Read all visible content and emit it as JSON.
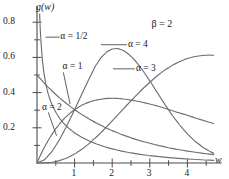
{
  "chart_data": {
    "type": "line",
    "title": "",
    "subtitle": "",
    "xlabel": "w",
    "ylabel": "g(w)",
    "xlim": [
      0,
      4.75
    ],
    "ylim": [
      0,
      0.88
    ],
    "xticks": [
      "1",
      "2",
      "3",
      "4"
    ],
    "xtick_values": [
      1,
      2,
      3,
      4
    ],
    "x_minor_step": 0.5,
    "yticks": [
      "0.2",
      "0.4",
      "0.6",
      "0.8"
    ],
    "ytick_values": [
      0.2,
      0.4,
      0.6,
      0.8
    ],
    "y_minor_step": 0.1,
    "grid": false,
    "legend_position": "inline-annotations",
    "annotation": "β = 2",
    "annotation_x": 3.1,
    "annotation_y": 0.79,
    "distribution": "gamma",
    "beta": 2,
    "series": [
      {
        "name": "α = 1/2",
        "alpha": 0.5,
        "label": "α = 1/2",
        "label_x": 0.62,
        "label_y": 0.715,
        "leader_from": [
          0.6,
          0.715
        ],
        "leader_to": [
          0.23,
          0.715
        ],
        "peak_x": 0.0,
        "peak_y": 0.88,
        "points": [
          [
            0.02,
            1.58
          ],
          [
            0.04,
            1.12
          ],
          [
            0.06,
            0.913
          ],
          [
            0.08,
            0.789
          ],
          [
            0.1,
            0.704
          ],
          [
            0.14,
            0.591
          ],
          [
            0.18,
            0.518
          ],
          [
            0.22,
            0.465
          ],
          [
            0.26,
            0.424
          ],
          [
            0.3,
            0.391
          ],
          [
            0.35,
            0.358
          ],
          [
            0.4,
            0.331
          ],
          [
            0.5,
            0.288
          ],
          [
            0.6,
            0.255
          ],
          [
            0.7,
            0.228
          ],
          [
            0.8,
            0.206
          ],
          [
            0.9,
            0.188
          ],
          [
            1.0,
            0.171
          ],
          [
            1.2,
            0.145
          ],
          [
            1.4,
            0.124
          ],
          [
            1.6,
            0.107
          ],
          [
            1.8,
            0.0922
          ],
          [
            2.0,
            0.0801
          ],
          [
            2.25,
            0.0677
          ],
          [
            2.5,
            0.0575
          ],
          [
            2.75,
            0.049
          ],
          [
            3.0,
            0.0419
          ],
          [
            3.25,
            0.0359
          ],
          [
            3.5,
            0.0309
          ],
          [
            3.75,
            0.0266
          ],
          [
            4.0,
            0.0229
          ],
          [
            4.25,
            0.0198
          ],
          [
            4.5,
            0.0171
          ],
          [
            4.7,
            0.0153
          ]
        ]
      },
      {
        "name": "α = 1",
        "alpha": 1,
        "label": "α = 1",
        "label_x": 0.68,
        "label_y": 0.545,
        "leader_from": [
          0.7,
          0.515
        ],
        "leader_to": [
          0.88,
          0.335
        ],
        "peak_x": 0.0,
        "peak_y": 0.5,
        "points": [
          [
            0.0,
            0.5
          ],
          [
            0.1,
            0.476
          ],
          [
            0.2,
            0.452
          ],
          [
            0.3,
            0.43
          ],
          [
            0.4,
            0.409
          ],
          [
            0.5,
            0.389
          ],
          [
            0.6,
            0.37
          ],
          [
            0.8,
            0.335
          ],
          [
            1.0,
            0.303
          ],
          [
            1.2,
            0.274
          ],
          [
            1.4,
            0.248
          ],
          [
            1.6,
            0.225
          ],
          [
            1.8,
            0.203
          ],
          [
            2.0,
            0.184
          ],
          [
            2.25,
            0.162
          ],
          [
            2.5,
            0.143
          ],
          [
            2.75,
            0.126
          ],
          [
            3.0,
            0.112
          ],
          [
            3.25,
            0.0986
          ],
          [
            3.5,
            0.0869
          ],
          [
            3.75,
            0.0766
          ],
          [
            4.0,
            0.0677
          ],
          [
            4.25,
            0.0596
          ],
          [
            4.5,
            0.0527
          ],
          [
            4.7,
            0.0477
          ]
        ]
      },
      {
        "name": "α = 2",
        "alpha": 2,
        "label": "α = 2",
        "label_x": 0.13,
        "label_y": 0.315,
        "leader_from": [
          0.3,
          0.288
        ],
        "leader_to": [
          0.52,
          0.155
        ],
        "peak_x": 1.4,
        "peak_y": 0.432,
        "points": [
          [
            0.0,
            0.0
          ],
          [
            0.1,
            0.0476
          ],
          [
            0.2,
            0.0905
          ],
          [
            0.3,
            0.129
          ],
          [
            0.4,
            0.164
          ],
          [
            0.5,
            0.195
          ],
          [
            0.6,
            0.222
          ],
          [
            0.7,
            0.247
          ],
          [
            0.8,
            0.268
          ],
          [
            0.9,
            0.287
          ],
          [
            1.0,
            0.303
          ],
          [
            1.1,
            0.317
          ],
          [
            1.2,
            0.329
          ],
          [
            1.3,
            0.339
          ],
          [
            1.4,
            0.347
          ],
          [
            1.5,
            0.354
          ],
          [
            1.6,
            0.359
          ],
          [
            1.8,
            0.366
          ],
          [
            2.0,
            0.368
          ],
          [
            2.2,
            0.366
          ],
          [
            2.4,
            0.361
          ],
          [
            2.6,
            0.354
          ],
          [
            2.8,
            0.345
          ],
          [
            3.0,
            0.335
          ],
          [
            3.25,
            0.321
          ],
          [
            3.5,
            0.304
          ],
          [
            3.75,
            0.287
          ],
          [
            4.0,
            0.271
          ],
          [
            4.25,
            0.253
          ],
          [
            4.5,
            0.237
          ],
          [
            4.7,
            0.224
          ]
        ]
      },
      {
        "name": "α = 3",
        "alpha": 3,
        "label": "α = 3",
        "label_x": 2.63,
        "label_y": 0.535,
        "leader_from": [
          2.6,
          0.535
        ],
        "leader_to": [
          2.02,
          0.535
        ],
        "peak_x": 1.7,
        "peak_y": 0.598,
        "points": [
          [
            0.0,
            0.0
          ],
          [
            0.2,
            0.0182
          ],
          [
            0.4,
            0.0657
          ],
          [
            0.6,
            0.133
          ],
          [
            0.8,
            0.214
          ],
          [
            1.0,
            0.303
          ],
          [
            1.2,
            0.395
          ],
          [
            1.4,
            0.485
          ],
          [
            1.55,
            0.55
          ],
          [
            1.7,
            0.598
          ],
          [
            1.85,
            0.63
          ],
          [
            2.0,
            0.648
          ],
          [
            2.15,
            0.65
          ],
          [
            2.3,
            0.639
          ],
          [
            2.45,
            0.616
          ],
          [
            2.6,
            0.584
          ],
          [
            2.8,
            0.53
          ],
          [
            3.0,
            0.467
          ],
          [
            3.2,
            0.4
          ],
          [
            3.4,
            0.333
          ],
          [
            3.6,
            0.27
          ],
          [
            3.8,
            0.214
          ],
          [
            4.0,
            0.165
          ],
          [
            4.2,
            0.124
          ],
          [
            4.4,
            0.0913
          ],
          [
            4.6,
            0.0657
          ],
          [
            4.7,
            0.0551
          ]
        ]
      },
      {
        "name": "α = 4",
        "alpha": 4,
        "label": "α = 4",
        "label_x": 2.42,
        "label_y": 0.672,
        "leader_from": [
          2.39,
          0.672
        ],
        "leader_to": [
          1.7,
          0.672
        ],
        "peak_x": 1.85,
        "peak_y": 0.772,
        "points": [
          [
            0.0,
            0.0
          ],
          [
            0.2,
            0.0006
          ],
          [
            0.4,
            0.0044
          ],
          [
            0.6,
            0.0133
          ],
          [
            0.8,
            0.0286
          ],
          [
            1.0,
            0.0505
          ],
          [
            1.2,
            0.079
          ],
          [
            1.4,
            0.113
          ],
          [
            1.6,
            0.152
          ],
          [
            1.8,
            0.194
          ],
          [
            2.0,
            0.239
          ],
          [
            2.2,
            0.285
          ],
          [
            2.4,
            0.331
          ],
          [
            2.6,
            0.376
          ],
          [
            2.8,
            0.419
          ],
          [
            3.0,
            0.459
          ],
          [
            3.2,
            0.496
          ],
          [
            3.4,
            0.528
          ],
          [
            3.6,
            0.555
          ],
          [
            3.8,
            0.577
          ],
          [
            4.0,
            0.594
          ],
          [
            4.2,
            0.605
          ],
          [
            4.4,
            0.611
          ],
          [
            4.6,
            0.613
          ],
          [
            4.7,
            0.612
          ]
        ]
      }
    ],
    "axis_color": "#4d4d4d",
    "curve_color": "#6e6e6e",
    "text_color": "#1a1a1a"
  },
  "axes": {
    "y_axis_label": "g(w)",
    "x_axis_label": "w"
  }
}
